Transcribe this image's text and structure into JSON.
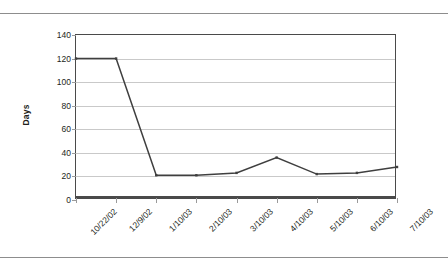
{
  "chart_data": {
    "type": "line",
    "title": "",
    "xlabel": "",
    "ylabel": "Days",
    "categories": [
      "10/22/02",
      "12/9/02",
      "1/10/03",
      "2/10/03",
      "3/10/03",
      "4/10/03",
      "5/10/03",
      "6/10/03",
      "7/10/03"
    ],
    "values": [
      120,
      120,
      21,
      21,
      23,
      36,
      22,
      23,
      28
    ],
    "series": [
      {
        "name": "Days",
        "values": [
          120,
          120,
          21,
          21,
          23,
          36,
          22,
          23,
          28
        ]
      }
    ],
    "ylim": [
      0,
      140
    ],
    "yticks": [
      0,
      20,
      40,
      60,
      80,
      100,
      120,
      140
    ],
    "ytick_labels": [
      "0",
      "20",
      "40",
      "60",
      "80",
      "100",
      "120",
      "140"
    ],
    "grid": true,
    "legend": false,
    "legend_position": "none",
    "line_color": "#3f3f3f",
    "grid_color": "#c9c9c9",
    "axis_color": "#4a4a4a",
    "background_color": "#ffffff"
  }
}
